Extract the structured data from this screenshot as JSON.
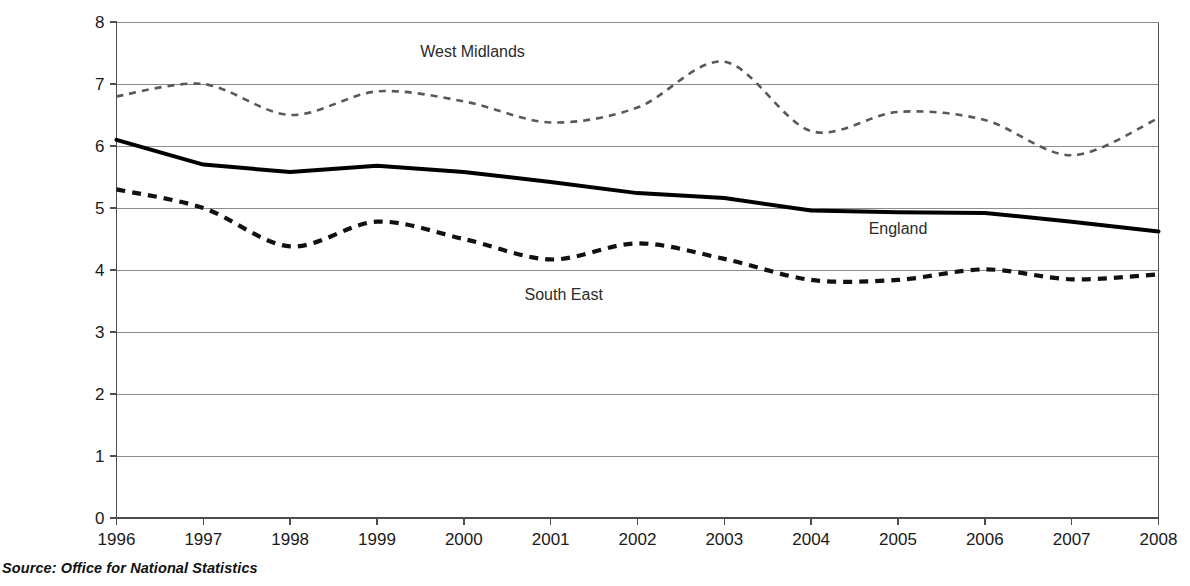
{
  "chart_data": {
    "type": "line",
    "title": "",
    "subtitle": "",
    "xlabel": "",
    "ylabel": "",
    "xlim": [
      1996,
      2008
    ],
    "ylim": [
      0,
      8
    ],
    "ytick_step": 1,
    "grid": true,
    "legend_position": "inline-labels",
    "x": [
      1996,
      1997,
      1998,
      1999,
      2000,
      2001,
      2002,
      2003,
      2004,
      2005,
      2006,
      2007,
      2008
    ],
    "categories": [
      "1996",
      "1997",
      "1998",
      "1999",
      "2000",
      "2001",
      "2002",
      "2003",
      "2004",
      "2005",
      "2006",
      "2007",
      "2008"
    ],
    "yticks": [
      "0",
      "1",
      "2",
      "3",
      "4",
      "5",
      "6",
      "7",
      "8"
    ],
    "series": [
      {
        "name": "West Midlands",
        "style": "dashed-thin",
        "color": "#595959",
        "values": [
          6.8,
          7.0,
          6.5,
          6.88,
          6.72,
          6.38,
          6.62,
          7.36,
          6.24,
          6.55,
          6.42,
          5.85,
          6.45
        ],
        "label_x": 2000.1,
        "label_y": 7.43
      },
      {
        "name": "England",
        "style": "solid-thick",
        "color": "#000000",
        "values": [
          6.1,
          5.7,
          5.58,
          5.68,
          5.58,
          5.42,
          5.24,
          5.16,
          4.96,
          4.93,
          4.92,
          4.78,
          4.62
        ],
        "label_x": 2005.0,
        "label_y": 4.58
      },
      {
        "name": "South East",
        "style": "dashed-thick",
        "color": "#111111",
        "values": [
          5.3,
          5.0,
          4.38,
          4.78,
          4.5,
          4.17,
          4.43,
          4.18,
          3.84,
          3.84,
          4.01,
          3.85,
          3.93
        ],
        "label_x": 2001.15,
        "label_y": 3.52
      }
    ]
  },
  "source": {
    "text": "Source: Office for National Statistics"
  }
}
